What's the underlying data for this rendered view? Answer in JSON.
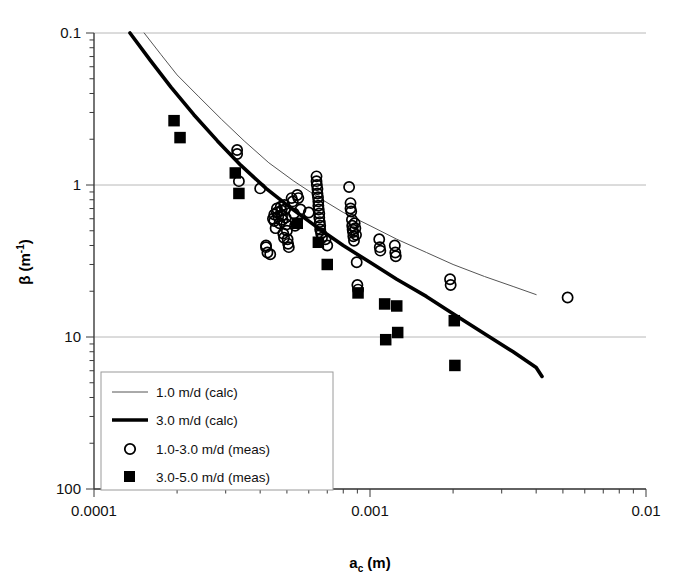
{
  "chart_data": {
    "type": "scatter",
    "title": "",
    "xlabel": "a_c (m)",
    "ylabel": "β (m⁻¹)",
    "xscale": "log",
    "yscale": "log",
    "xlim": [
      0.0001,
      0.01
    ],
    "ylim": [
      0.1,
      100
    ],
    "grid": "horizontal major only",
    "xticks": [
      0.0001,
      0.001,
      0.01
    ],
    "xtick_labels": [
      "0.0001",
      "0.001",
      "0.01"
    ],
    "yticks": [
      0.1,
      1,
      10,
      100
    ],
    "ytick_labels": [
      "0.1",
      "1",
      "10",
      "100"
    ],
    "legend_position": "lower left inside axes",
    "series": [
      {
        "name": "1.0 m/d (calc)",
        "type": "line",
        "style": "thin",
        "color": "#555555",
        "linewidth": 1,
        "points": [
          [
            0.000152,
            100.0
          ],
          [
            0.000175,
            72.0
          ],
          [
            0.0002,
            53.0
          ],
          [
            0.00024,
            38.0
          ],
          [
            0.00029,
            27.0
          ],
          [
            0.00035,
            19.5
          ],
          [
            0.00043,
            14.0
          ],
          [
            0.00053,
            10.6
          ],
          [
            0.00065,
            8.3
          ],
          [
            0.0008,
            6.6
          ],
          [
            0.001,
            5.4
          ],
          [
            0.00125,
            4.4
          ],
          [
            0.0016,
            3.6
          ],
          [
            0.002,
            3.0
          ],
          [
            0.0026,
            2.5
          ],
          [
            0.0033,
            2.15
          ],
          [
            0.004,
            1.9
          ]
        ]
      },
      {
        "name": "3.0 m/d (calc)",
        "type": "line",
        "style": "thick",
        "color": "#000000",
        "linewidth": 3.6,
        "points": [
          [
            0.000135,
            100.0
          ],
          [
            0.00016,
            66.0
          ],
          [
            0.00019,
            44.0
          ],
          [
            0.00023,
            29.0
          ],
          [
            0.00028,
            19.5
          ],
          [
            0.00034,
            13.5
          ],
          [
            0.00042,
            9.5
          ],
          [
            0.00052,
            7.0
          ],
          [
            0.00065,
            5.2
          ],
          [
            0.0008,
            4.0
          ],
          [
            0.001,
            3.1
          ],
          [
            0.00125,
            2.4
          ],
          [
            0.0016,
            1.85
          ],
          [
            0.002,
            1.42
          ],
          [
            0.0026,
            1.05
          ],
          [
            0.0033,
            0.8
          ],
          [
            0.004,
            0.63
          ],
          [
            0.0042,
            0.55
          ]
        ]
      },
      {
        "name": "1.0-3.0 m/d (meas)",
        "type": "scatter",
        "marker": "open-circle",
        "color": "#000000",
        "points": [
          [
            0.00033,
            17.0
          ],
          [
            0.00033,
            16.0
          ],
          [
            0.000335,
            10.6
          ],
          [
            0.0004,
            9.5
          ],
          [
            0.00042,
            4.0
          ],
          [
            0.00042,
            3.9
          ],
          [
            0.000425,
            3.6
          ],
          [
            0.000435,
            3.5
          ],
          [
            0.000445,
            6.0
          ],
          [
            0.00045,
            6.4
          ],
          [
            0.00045,
            5.8
          ],
          [
            0.000455,
            5.2
          ],
          [
            0.00046,
            7.0
          ],
          [
            0.00046,
            6.6
          ],
          [
            0.000465,
            6.2
          ],
          [
            0.00047,
            5.6
          ],
          [
            0.000475,
            7.2
          ],
          [
            0.000478,
            6.8
          ],
          [
            0.00048,
            6.3
          ],
          [
            0.000482,
            5.9
          ],
          [
            0.000485,
            4.8
          ],
          [
            0.000488,
            4.5
          ],
          [
            0.00049,
            7.4
          ],
          [
            0.000492,
            6.9
          ],
          [
            0.000495,
            6.1
          ],
          [
            0.000498,
            5.5
          ],
          [
            0.0005,
            5.0
          ],
          [
            0.000503,
            4.4
          ],
          [
            0.000505,
            4.1
          ],
          [
            0.000508,
            3.9
          ],
          [
            0.00052,
            8.2
          ],
          [
            0.000525,
            7.8
          ],
          [
            0.00053,
            6.5
          ],
          [
            0.000535,
            5.4
          ],
          [
            0.000545,
            8.6
          ],
          [
            0.00055,
            8.2
          ],
          [
            0.00056,
            6.9
          ],
          [
            0.0006,
            6.6
          ],
          [
            0.00064,
            11.4
          ],
          [
            0.00064,
            10.6
          ],
          [
            0.000642,
            10.0
          ],
          [
            0.000645,
            9.4
          ],
          [
            0.000645,
            8.8
          ],
          [
            0.000648,
            8.3
          ],
          [
            0.00065,
            7.8
          ],
          [
            0.00065,
            7.3
          ],
          [
            0.000652,
            6.9
          ],
          [
            0.000655,
            6.5
          ],
          [
            0.000655,
            6.1
          ],
          [
            0.000658,
            5.7
          ],
          [
            0.00066,
            5.4
          ],
          [
            0.00066,
            5.1
          ],
          [
            0.000665,
            4.8
          ],
          [
            0.00067,
            4.5
          ],
          [
            0.00069,
            4.4
          ],
          [
            0.0007,
            4.0
          ],
          [
            0.00084,
            9.7
          ],
          [
            0.00085,
            7.6
          ],
          [
            0.00085,
            7.0
          ],
          [
            0.000855,
            6.7
          ],
          [
            0.00086,
            5.9
          ],
          [
            0.000862,
            5.4
          ],
          [
            0.000865,
            5.1
          ],
          [
            0.000868,
            4.9
          ],
          [
            0.00087,
            4.6
          ],
          [
            0.000875,
            4.3
          ],
          [
            0.00088,
            5.6
          ],
          [
            0.000885,
            5.2
          ],
          [
            0.00089,
            4.7
          ],
          [
            0.000895,
            3.1
          ],
          [
            0.0009,
            2.2
          ],
          [
            0.000905,
            2.05
          ],
          [
            0.00108,
            4.4
          ],
          [
            0.001085,
            3.9
          ],
          [
            0.00109,
            3.7
          ],
          [
            0.00123,
            4.0
          ],
          [
            0.001235,
            3.6
          ],
          [
            0.00124,
            3.4
          ],
          [
            0.00195,
            2.4
          ],
          [
            0.00196,
            2.2
          ],
          [
            0.0052,
            1.82
          ]
        ]
      },
      {
        "name": "3.0-5.0 m/d (meas)",
        "type": "scatter",
        "marker": "filled-square",
        "color": "#000000",
        "points": [
          [
            0.000195,
            26.5
          ],
          [
            0.000205,
            20.5
          ],
          [
            0.000325,
            12.0
          ],
          [
            0.000335,
            8.8
          ],
          [
            0.000545,
            5.6
          ],
          [
            0.00065,
            4.2
          ],
          [
            0.0007,
            3.0
          ],
          [
            0.000905,
            1.95
          ],
          [
            0.00113,
            1.65
          ],
          [
            0.00114,
            0.96
          ],
          [
            0.00125,
            1.6
          ],
          [
            0.00126,
            1.07
          ],
          [
            0.00202,
            1.28
          ],
          [
            0.00203,
            0.65
          ]
        ]
      }
    ]
  },
  "axes": {
    "y_label_parts": {
      "symbol": "β",
      "unit_open": " (m",
      "unit_sup": "-1",
      "unit_close": ")"
    },
    "x_label_parts": {
      "symbol": "a",
      "subscript": "c",
      "unit": " (m)"
    },
    "x_tick_labels": [
      "0.0001",
      "0.001",
      "0.01"
    ],
    "y_tick_labels": [
      "100",
      "10",
      "1",
      "0.1"
    ]
  },
  "legend": {
    "entries": [
      {
        "label": "1.0 m/d (calc)",
        "marker": "thin-line"
      },
      {
        "label": "3.0 m/d (calc)",
        "marker": "thick-line"
      },
      {
        "label": "1.0-3.0 m/d (meas)",
        "marker": "open-circle"
      },
      {
        "label": "3.0-5.0 m/d (meas)",
        "marker": "filled-square"
      }
    ]
  },
  "colors": {
    "axis": "#3a3a3a",
    "grid": "#b8b8b8",
    "thin_line": "#555555",
    "thick_line": "#000000",
    "marker": "#000000",
    "legend_border": "#9a9a9a",
    "background": "#ffffff"
  }
}
